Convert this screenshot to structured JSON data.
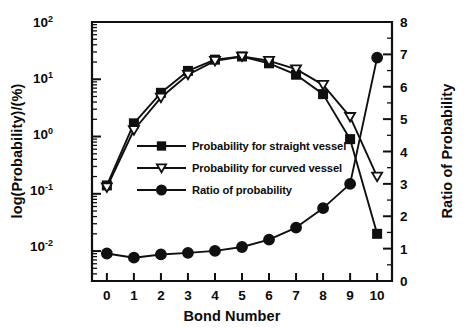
{
  "figure": {
    "background_color": "#ffffff",
    "ink_color": "#101010"
  },
  "chart_data": {
    "type": "line",
    "title": "",
    "subtitle": "",
    "xlabel": "Bond Number",
    "ylabel": "log(Probability)/(%)",
    "y2label": "Ratio of Probability",
    "x": [
      0,
      1,
      2,
      3,
      4,
      5,
      6,
      7,
      8,
      9,
      10
    ],
    "xtick_labels": [
      "0",
      "1",
      "2",
      "3",
      "4",
      "5",
      "6",
      "7",
      "8",
      "9",
      "10"
    ],
    "xlim": [
      -0.55,
      10.55
    ],
    "yscale": "log",
    "ylim": [
      0.003,
      100
    ],
    "ytick_labels": [
      "10-2",
      "10-1",
      "100",
      "101",
      "102"
    ],
    "ytick_bases": [
      "10",
      "10",
      "10",
      "10",
      "10"
    ],
    "ytick_exponents": [
      "-2",
      "-1",
      "0",
      "1",
      "2"
    ],
    "ytick_values": [
      0.01,
      0.1,
      1,
      10,
      100
    ],
    "y2lim": [
      0,
      8
    ],
    "y2tick_labels": [
      "0",
      "1",
      "2",
      "3",
      "4",
      "5",
      "6",
      "7",
      "8"
    ],
    "y2tick_values": [
      0,
      1,
      2,
      3,
      4,
      5,
      6,
      7,
      8
    ],
    "grid": false,
    "legend_position": "center",
    "series": [
      {
        "name": "Probability for straight vessel",
        "axis": "left",
        "marker": "filled-square",
        "values": [
          0.14,
          1.7,
          5.8,
          14.0,
          22.0,
          25.0,
          19.0,
          12.0,
          5.5,
          0.9,
          0.02
        ]
      },
      {
        "name": "Probability for curved vessel",
        "axis": "left",
        "marker": "open-down-triangle",
        "values": [
          0.13,
          1.3,
          4.8,
          12.0,
          21.0,
          25.0,
          21.0,
          15.0,
          8.0,
          2.2,
          0.2
        ]
      },
      {
        "name": "Ratio of probability",
        "axis": "right",
        "marker": "filled-circle",
        "values": [
          0.85,
          0.72,
          0.82,
          0.87,
          0.93,
          1.05,
          1.28,
          1.65,
          2.25,
          3.0,
          6.9
        ]
      }
    ]
  },
  "legend": {
    "entries": [
      {
        "label": "Probability for straight vessel",
        "marker": "filled-square"
      },
      {
        "label": "Probability for curved vessel",
        "marker": "open-down-triangle"
      },
      {
        "label": "Ratio of probability",
        "marker": "filled-circle"
      }
    ]
  }
}
